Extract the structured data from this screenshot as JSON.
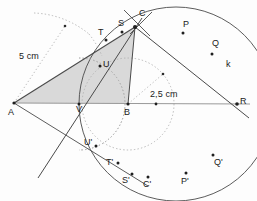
{
  "figure": {
    "type": "geometry-construction"
  },
  "colors": {
    "stroke": "#3a3a3a",
    "light_stroke": "#8f8f8f",
    "fill": "#d9d9d9",
    "dotted": "#a9a9a9",
    "label": "#1a1a1a",
    "background": "#ffffff"
  },
  "labels": {
    "A": "A",
    "B": "B",
    "C": "C",
    "R": "R",
    "k": "k",
    "P": "P",
    "Q": "Q",
    "S": "S",
    "T": "T",
    "U": "U",
    "V": "V",
    "U_prime": "U'",
    "T_prime": "T'",
    "S_prime": "S'",
    "C_prime": "C'",
    "P_prime": "P'",
    "Q_prime": "Q'",
    "dim_left": "5 cm",
    "dim_right": "2,5 cm"
  },
  "points": [
    {
      "name": "A",
      "x": 14,
      "y": 103
    },
    {
      "name": "B",
      "x": 128,
      "y": 104
    },
    {
      "name": "C",
      "x": 135,
      "y": 27
    },
    {
      "name": "R",
      "x": 237,
      "y": 104
    },
    {
      "name": "P",
      "x": 183,
      "y": 33
    },
    {
      "name": "Q",
      "x": 212,
      "y": 54
    },
    {
      "name": "S",
      "x": 122,
      "y": 32
    },
    {
      "name": "T",
      "x": 106,
      "y": 40
    },
    {
      "name": "U",
      "x": 100,
      "y": 66
    },
    {
      "name": "V",
      "x": 79,
      "y": 104
    },
    {
      "name": "U_prime",
      "x": 96,
      "y": 146
    },
    {
      "name": "T_prime",
      "x": 116,
      "y": 164
    },
    {
      "name": "S_prime",
      "x": 130,
      "y": 175
    },
    {
      "name": "C_prime",
      "x": 146,
      "y": 178
    },
    {
      "name": "P_prime",
      "x": 186,
      "y": 174
    },
    {
      "name": "Q_prime",
      "x": 213,
      "y": 156
    }
  ],
  "circles": [
    {
      "name": "k",
      "cx": 176,
      "cy": 104,
      "r": 97,
      "style": "solid"
    },
    {
      "name": "inner-dotted-circle",
      "cx": 128,
      "cy": 104,
      "r": 46,
      "style": "dotted"
    },
    {
      "name": "construction-arc-left",
      "cx": 14,
      "cy": 103,
      "r": 92,
      "style": "dotted"
    },
    {
      "name": "construction-arc-v",
      "cx": 79,
      "cy": 104,
      "r": 46,
      "style": "dotted"
    }
  ],
  "segments": [
    {
      "from": "A",
      "to": "R",
      "style": "light-solid",
      "note": "baseline through B"
    },
    {
      "from": "A",
      "to": "C",
      "style": "solid"
    },
    {
      "from": "C",
      "to": "R",
      "style": "solid"
    },
    {
      "from": "C",
      "to": "B",
      "style": "solid"
    },
    {
      "from": "C",
      "to": "V",
      "style": "solid"
    },
    {
      "from": "A",
      "to": "V",
      "style": "solid"
    }
  ],
  "shaded_region": {
    "name": "triangle-A-C-B",
    "vertices": [
      "A",
      "C",
      "B"
    ],
    "fill": "#d9d9d9"
  },
  "dimension_lines": [
    {
      "label": "5 cm",
      "from": "A",
      "to": "construction-arc-left"
    },
    {
      "label": "2,5 cm",
      "from": "B",
      "to": "inner-dotted-circle"
    }
  ]
}
